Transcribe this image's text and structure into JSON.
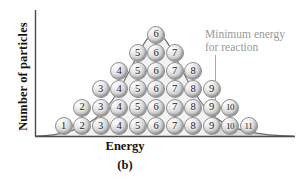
{
  "figure": {
    "caption": "(b)",
    "y_axis_title": "Number of particles",
    "x_axis_title": "Energy",
    "annotation_line_1": "Minimum energy",
    "annotation_line_2": "for reaction",
    "annotation_color": "#9a9a9a",
    "curve_color": "#6b6b6b",
    "axis_color": "#4a4a4a",
    "shade_color": "#dcdcdc"
  },
  "chart_data": {
    "type": "area",
    "title": "",
    "subtitle": "",
    "xlabel": "Energy",
    "ylabel": "Number of particles",
    "caption": "(b)",
    "grid": false,
    "legend_position": "upper-right",
    "axis_ticks_shown": false,
    "distribution": "Maxwell-Boltzmann",
    "annotations": [
      {
        "text": "Minimum energy for reaction",
        "type": "vertical-threshold-line",
        "x_fraction": 0.69
      }
    ],
    "particle_rows": [
      {
        "row": 1,
        "labels": [
          "6"
        ]
      },
      {
        "row": 2,
        "labels": [
          "5",
          "6",
          "7"
        ]
      },
      {
        "row": 3,
        "labels": [
          "4",
          "5",
          "6",
          "7",
          "8"
        ]
      },
      {
        "row": 4,
        "labels": [
          "3",
          "4",
          "5",
          "6",
          "7",
          "8",
          "9"
        ]
      },
      {
        "row": 5,
        "labels": [
          "2",
          "3",
          "4",
          "5",
          "6",
          "7",
          "8",
          "9",
          "10"
        ]
      },
      {
        "row": 6,
        "labels": [
          "1",
          "2",
          "3",
          "4",
          "5",
          "6",
          "7",
          "8",
          "9",
          "10",
          "11"
        ]
      }
    ],
    "particle_total": 36,
    "column_energy_levels": [
      "1",
      "2",
      "3",
      "4",
      "5",
      "6",
      "7",
      "8",
      "9",
      "10",
      "11"
    ],
    "column_counts": [
      1,
      2,
      3,
      4,
      5,
      6,
      5,
      4,
      3,
      2,
      1
    ]
  }
}
